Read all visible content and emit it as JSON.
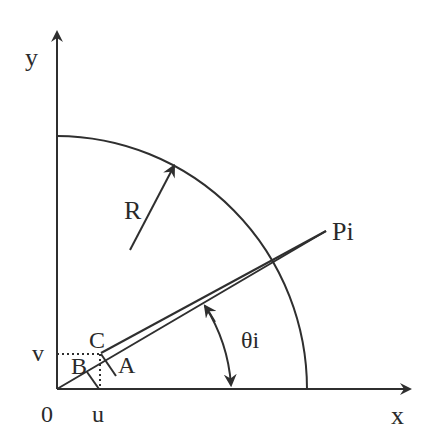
{
  "diagram": {
    "type": "geometry",
    "colors": {
      "stroke": "#2f2f2f",
      "text": "#2a2a2a",
      "background": "#ffffff"
    },
    "axes": {
      "x_label": "x",
      "y_label": "y",
      "origin_label": "0"
    },
    "labels": {
      "radius": "R",
      "point_p": "Pi",
      "angle": "θi",
      "point_a": "A",
      "point_b": "B",
      "point_c": "C",
      "coord_u": "u",
      "coord_v": "v"
    },
    "geometry_px": {
      "origin": [
        57,
        389
      ],
      "x_axis_end": [
        412,
        389
      ],
      "y_axis_end": [
        57,
        30
      ],
      "arc_radius": 251,
      "point_p": [
        326,
        231
      ],
      "point_c": [
        101,
        354
      ],
      "point_a": [
        117,
        354
      ],
      "u": 101,
      "v": 354
    }
  }
}
